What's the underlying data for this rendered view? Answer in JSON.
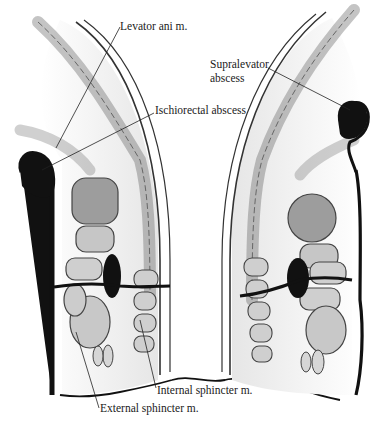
{
  "figure": {
    "labels": {
      "levator": "Levator ani m.",
      "supralevator_line1": "Supralevator",
      "supralevator_line2": "abscess",
      "ischiorectal": "Ischiorectal abscess",
      "internal_sphincter": "Internal sphincter m.",
      "external_sphincter": "External sphincter m."
    },
    "colors": {
      "ink": "#111111",
      "muscle_fill": "#c9c9c9",
      "muscle_stroke": "#444444",
      "background": "#ffffff",
      "tissue_shade": "#ececec"
    }
  }
}
